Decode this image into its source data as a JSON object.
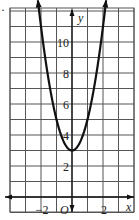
{
  "marker": "·",
  "chart_data": {
    "type": "line",
    "title": "",
    "equation_implied": "y = 2x^2 + 3",
    "xlabel": "x",
    "ylabel": "y",
    "origin_label": "O",
    "xlim": [
      -4,
      4
    ],
    "ylim": [
      -1,
      12.5
    ],
    "grid": true,
    "x_tick_labels": [
      {
        "x": -2,
        "label": "−2"
      },
      {
        "x": 2,
        "label": "2"
      }
    ],
    "y_tick_labels": [
      {
        "y": 2,
        "label": "2"
      },
      {
        "y": 4,
        "label": "4"
      },
      {
        "y": 6,
        "label": "6"
      },
      {
        "y": 8,
        "label": "8"
      },
      {
        "y": 10,
        "label": "10"
      }
    ],
    "series": [
      {
        "name": "parabola",
        "x": [
          -2.2,
          -2,
          -1.5,
          -1,
          -0.5,
          0,
          0.5,
          1,
          1.5,
          2,
          2.2
        ],
        "y": [
          12.68,
          11,
          7.5,
          5,
          3.5,
          3,
          3.5,
          5,
          7.5,
          11,
          12.68
        ],
        "arrows_at_ends": true,
        "vertex": [
          0,
          3
        ]
      }
    ]
  }
}
